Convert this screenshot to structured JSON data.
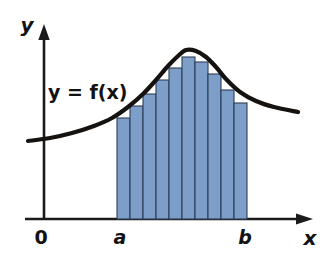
{
  "figure": {
    "background_color": "#ffffff",
    "width": 336,
    "height": 267
  },
  "labels": {
    "y_axis": "y",
    "x_axis": "x",
    "origin": "0",
    "lower_limit": "a",
    "upper_limit": "b",
    "function_equation": "y = f(x)"
  },
  "colors": {
    "bar_fill": "#7d9ec9",
    "bar_stroke": "#2d3c54",
    "curve": "#15120f",
    "axis": "#1b1b1b",
    "text": "#121212"
  },
  "chart_data": {
    "type": "bar",
    "xlabel": "x",
    "ylabel": "y",
    "grid": false,
    "legend": null,
    "axis_origin_label": "0",
    "interval": {
      "lower_label": "a",
      "upper_label": "b",
      "lower_x_px": 117,
      "upper_x_px": 247
    },
    "bar_count": 10,
    "categories": [
      "1",
      "2",
      "3",
      "4",
      "5",
      "6",
      "7",
      "8",
      "9",
      "10"
    ],
    "values": [
      101,
      113,
      125,
      139,
      151,
      162,
      157,
      145,
      129,
      116
    ],
    "bar_tops_px": [
      118,
      106,
      94,
      80,
      68,
      57,
      62,
      74,
      90,
      103
    ],
    "baseline_px": 219,
    "series": [
      {
        "name": "rectangle heights",
        "values": [
          101,
          113,
          125,
          139,
          151,
          162,
          157,
          145,
          129,
          116
        ]
      }
    ],
    "curve": {
      "name": "y = f(x)",
      "x_px": [
        28,
        50,
        72,
        94,
        112,
        128,
        143,
        156,
        168,
        178,
        186,
        196,
        206,
        216,
        226,
        240,
        256,
        274,
        298
      ],
      "y_px": [
        141,
        138,
        133,
        126,
        118,
        107,
        94,
        80,
        66,
        56,
        50,
        51,
        57,
        67,
        79,
        92,
        101,
        107,
        112
      ],
      "peak_px": [
        186,
        50
      ]
    },
    "axes": {
      "y_axis_x_px": 44,
      "y_axis_top_px": 27,
      "x_axis_y_px": 219,
      "x_axis_left_px": 25,
      "x_axis_right_px": 312
    }
  }
}
